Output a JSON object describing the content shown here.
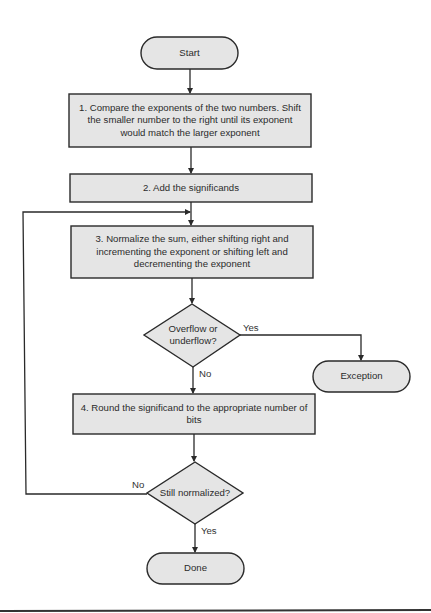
{
  "diagram": {
    "type": "flowchart",
    "nodes": {
      "start": {
        "shape": "terminator",
        "label": "Start"
      },
      "step1": {
        "shape": "process",
        "label": "1. Compare the exponents of the two numbers. Shift the smaller number to the right until its exponent would match the larger exponent"
      },
      "step2": {
        "shape": "process",
        "label": "2. Add the significands"
      },
      "step3": {
        "shape": "process",
        "label": "3. Normalize the sum, either shifting right and incrementing the exponent or shifting left and decrementing the exponent"
      },
      "decision1": {
        "shape": "decision",
        "label": "Overflow or underflow?"
      },
      "exception": {
        "shape": "terminator",
        "label": "Exception"
      },
      "step4": {
        "shape": "process",
        "label": "4. Round the significand to the appropriate number of bits"
      },
      "decision2": {
        "shape": "decision",
        "label": "Still normalized?"
      },
      "done": {
        "shape": "terminator",
        "label": "Done"
      }
    },
    "edges": [
      {
        "from": "start",
        "to": "step1",
        "label": ""
      },
      {
        "from": "step1",
        "to": "step2",
        "label": ""
      },
      {
        "from": "step2",
        "to": "step3",
        "label": ""
      },
      {
        "from": "step3",
        "to": "decision1",
        "label": ""
      },
      {
        "from": "decision1",
        "to": "exception",
        "label": "Yes"
      },
      {
        "from": "decision1",
        "to": "step4",
        "label": "No"
      },
      {
        "from": "step4",
        "to": "decision2",
        "label": ""
      },
      {
        "from": "decision2",
        "to": "step3",
        "label": "No"
      },
      {
        "from": "decision2",
        "to": "done",
        "label": "Yes"
      }
    ],
    "edge_labels": {
      "d1_yes": "Yes",
      "d1_no": "No",
      "d2_no": "No",
      "d2_yes": "Yes"
    },
    "colors": {
      "fill": "#e5e5e5",
      "stroke": "#2a2a2a"
    }
  }
}
